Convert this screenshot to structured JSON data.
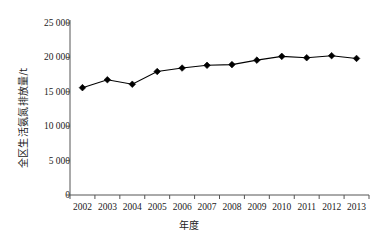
{
  "chart_data": {
    "type": "line",
    "title": "",
    "xlabel": "年度",
    "ylabel": "全区生活氨氮排放量/t",
    "categories": [
      "2002",
      "2003",
      "2004",
      "2005",
      "2006",
      "2007",
      "2008",
      "2009",
      "2010",
      "2011",
      "2012",
      "2013"
    ],
    "values": [
      15600,
      16750,
      16100,
      17950,
      18450,
      18850,
      18950,
      19600,
      20150,
      19950,
      20250,
      19850
    ],
    "series": [
      {
        "name": "全区生活氨氮排放量",
        "values": [
          15600,
          16750,
          16100,
          17950,
          18450,
          18850,
          18950,
          19600,
          20150,
          19950,
          20250,
          19850
        ]
      }
    ],
    "ylim": [
      0,
      25000
    ],
    "ytick_values": [
      0,
      5000,
      10000,
      15000,
      20000,
      25000
    ],
    "ytick_labels": [
      "0",
      "5 000",
      "10 000",
      "15 000",
      "20 000",
      "25 000"
    ],
    "xtick_labels": [
      "2002",
      "2003",
      "2004",
      "2005",
      "2006",
      "2007",
      "2008",
      "2009",
      "2010",
      "2011",
      "2012",
      "2013"
    ],
    "grid": false,
    "legend": false,
    "legend_position": "none",
    "marker": "diamond",
    "marker_color": "#000000",
    "line_color": "#000000",
    "axis_color": "#555555",
    "background_color": "#ffffff",
    "axes_visible": [
      "left",
      "bottom"
    ],
    "tick_direction": "out"
  }
}
